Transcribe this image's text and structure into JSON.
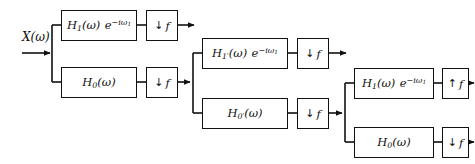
{
  "figure": {
    "kind": "block-diagram",
    "width": 475,
    "height": 164,
    "background_color": "#ffffff",
    "line_color": "#111111"
  },
  "input": {
    "label": "X(ω)",
    "label_plain": "X(omega)"
  },
  "stages": [
    {
      "id": "stage-1",
      "branches": [
        {
          "id": "stage-1-highpass",
          "filter_label": "H₁(ω) e⁻ⁱω₁",
          "filter_plain": "H_1(omega) e^{-i omega_1}",
          "rate_label": "↓ f",
          "rate_plain": "down f",
          "rate_direction": "down",
          "terminates": true
        },
        {
          "id": "stage-1-lowpass",
          "filter_label": "H₀(ω)",
          "filter_plain": "H_0(omega)",
          "rate_label": "↓ f",
          "rate_plain": "down f",
          "rate_direction": "down",
          "terminates": false
        }
      ]
    },
    {
      "id": "stage-2",
      "branches": [
        {
          "id": "stage-2-highpass",
          "filter_label": "H₁′(ω) e⁻ⁱω₁",
          "filter_plain": "H_1'(omega) e^{-i omega_1}",
          "rate_label": "↓ f",
          "rate_plain": "down f",
          "rate_direction": "down",
          "terminates": true
        },
        {
          "id": "stage-2-lowpass",
          "filter_label": "H₀′(ω)",
          "filter_plain": "H_0'(omega)",
          "rate_label": "↓ f",
          "rate_plain": "down f",
          "rate_direction": "down",
          "terminates": false
        }
      ]
    },
    {
      "id": "stage-3",
      "branches": [
        {
          "id": "stage-3-highpass",
          "filter_label": "H₁(ω) e⁻ⁱω₁",
          "filter_plain": "H_1(omega) e^{-i omega_1}",
          "rate_label": "↑ f",
          "rate_plain": "up f",
          "rate_direction": "up",
          "terminates": true
        },
        {
          "id": "stage-3-lowpass",
          "filter_label": "H₀(ω)",
          "filter_plain": "H_0(omega)",
          "rate_label": "↓ f",
          "rate_plain": "down f",
          "rate_direction": "down",
          "terminates": true
        }
      ]
    }
  ]
}
